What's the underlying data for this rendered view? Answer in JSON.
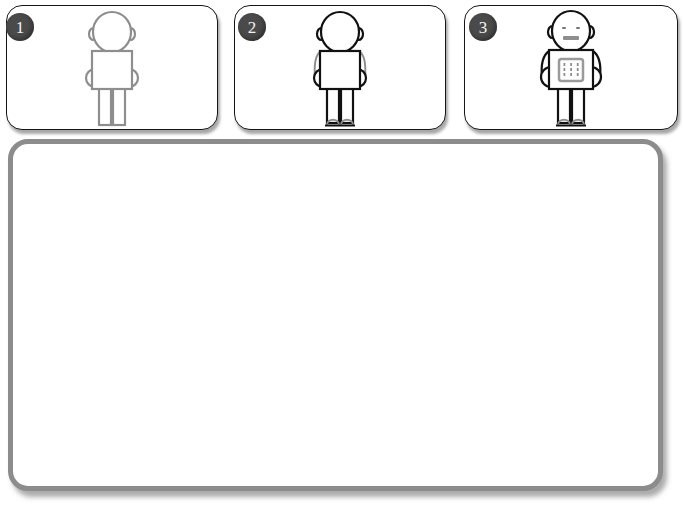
{
  "steps": [
    {
      "badge": "1",
      "name": "step-one",
      "figure_icon": "human-figure-outline-gray",
      "style": {
        "stroke": "#8e8e8e",
        "fill": "#ffffff",
        "detail": "#8e8e8e"
      },
      "features": {
        "head": true,
        "ears": true,
        "body": true,
        "stub_arms": true,
        "legs": true,
        "feet": false,
        "face": false,
        "chest_panel": false,
        "shoulders": false
      }
    },
    {
      "badge": "2",
      "name": "step-two",
      "figure_icon": "human-figure-outline-dark",
      "style": {
        "stroke": "#111111",
        "fill": "#ffffff",
        "detail": "#8e8e8e"
      },
      "features": {
        "head": true,
        "ears": true,
        "body": true,
        "stub_arms": true,
        "legs": true,
        "feet": true,
        "face": false,
        "chest_panel": false,
        "shoulders": true
      }
    },
    {
      "badge": "3",
      "name": "step-three",
      "figure_icon": "robot-figure-with-face-and-panel",
      "style": {
        "stroke": "#111111",
        "fill": "#ffffff",
        "detail": "#8e8e8e"
      },
      "features": {
        "head": true,
        "ears": true,
        "body": true,
        "stub_arms": true,
        "legs": true,
        "feet": true,
        "face": true,
        "chest_panel": true,
        "shoulders": true
      }
    }
  ],
  "workspace": {
    "name": "empty-canvas-panel",
    "content": "",
    "border_color": "#8c8c8c",
    "background_color": "#ffffff"
  },
  "colors": {
    "badge_background": "#4a4a4a",
    "badge_text": "#f2f2f2",
    "card_border": "#161616",
    "page_background": "#ffffff",
    "light_stroke": "#8e8e8e",
    "dark_stroke": "#111111"
  }
}
